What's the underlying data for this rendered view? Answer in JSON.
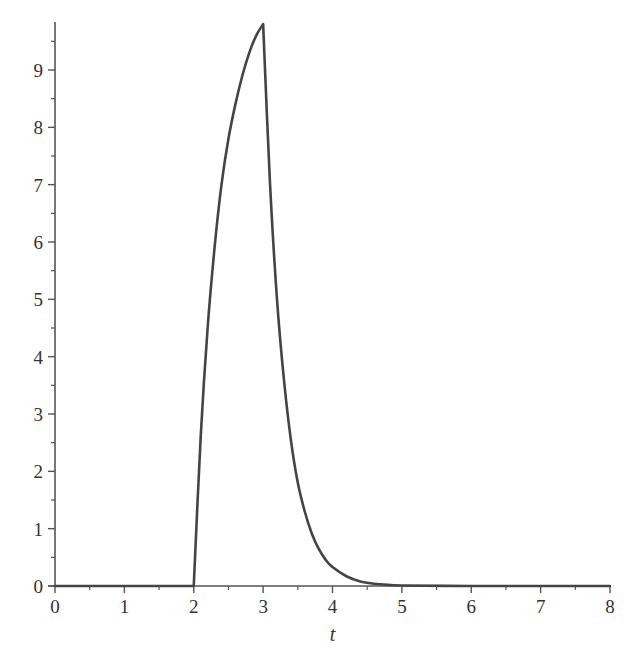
{
  "chart_data": {
    "type": "line",
    "title": "",
    "xlabel": "t",
    "ylabel": "",
    "xlim": [
      0,
      8
    ],
    "ylim": [
      0,
      9.8
    ],
    "x_ticks": [
      0,
      1,
      2,
      3,
      4,
      5,
      6,
      7,
      8
    ],
    "x_tick_labels": [
      "0",
      "1",
      "2",
      "3",
      "4",
      "5",
      "6",
      "7",
      "8"
    ],
    "x_minor_ticks": [
      0.5,
      1.5,
      2.5,
      3.5,
      4.5,
      5.5,
      6.5,
      7.5
    ],
    "y_ticks": [
      0,
      1,
      2,
      3,
      4,
      5,
      6,
      7,
      8,
      9
    ],
    "y_tick_labels": [
      "0",
      "1",
      "2",
      "3",
      "4",
      "5",
      "6",
      "7",
      "8",
      "9"
    ],
    "y_minor_ticks": [
      0.5,
      1.5,
      2.5,
      3.5,
      4.5,
      5.5,
      6.5,
      7.5,
      8.5,
      9.5
    ],
    "grid": false,
    "legend": null,
    "line_color": "#444444",
    "axis_color": "#555555",
    "series": [
      {
        "name": "response",
        "x": [
          0,
          1,
          2,
          2,
          2.1,
          2.2,
          2.3,
          2.4,
          2.5,
          2.6,
          2.7,
          2.8,
          2.9,
          3.0,
          3.0,
          3.1,
          3.2,
          3.3,
          3.4,
          3.5,
          3.6,
          3.7,
          3.8,
          3.9,
          4.0,
          4.2,
          4.4,
          4.6,
          4.8,
          5.0,
          6.0,
          7.0,
          8.0
        ],
        "values": [
          0,
          0,
          0,
          0.0,
          2.6,
          4.5,
          5.9,
          7.0,
          7.8,
          8.4,
          8.9,
          9.3,
          9.6,
          9.8,
          9.8,
          7.0,
          5.0,
          3.6,
          2.55,
          1.8,
          1.3,
          0.92,
          0.65,
          0.46,
          0.33,
          0.17,
          0.08,
          0.04,
          0.02,
          0.01,
          0.0,
          0.0,
          0.0
        ]
      }
    ]
  }
}
